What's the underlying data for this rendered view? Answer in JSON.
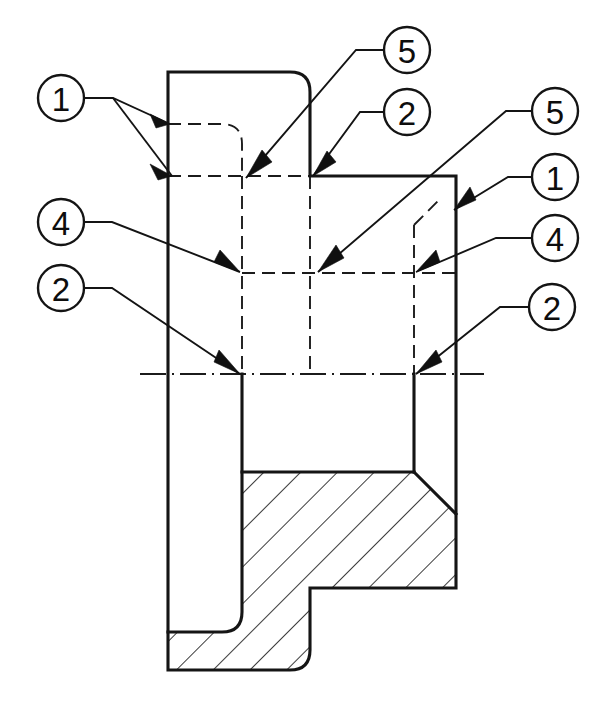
{
  "drawing": {
    "title": "Sectioned rotational part — feature callouts",
    "width": 607,
    "height": 708,
    "background_color": "#ffffff",
    "line_color": "#141414",
    "hatch_color": "#181818",
    "view_type": "half-section elevation",
    "line_styles": {
      "visible_edge": "solid thick",
      "hidden_edge": "dashed",
      "axis": "dash-dot centerline",
      "section_fill": "45-degree hatching"
    }
  },
  "balloons": [
    {
      "id": "balloon-1-top-left",
      "label": "1",
      "cx": 61,
      "cy": 98,
      "r": 23
    },
    {
      "id": "balloon-4-left",
      "label": "4",
      "cx": 61,
      "cy": 222,
      "r": 23
    },
    {
      "id": "balloon-2-left",
      "label": "2",
      "cx": 61,
      "cy": 288,
      "r": 23
    },
    {
      "id": "balloon-5-top-center",
      "label": "5",
      "cx": 407,
      "cy": 50,
      "r": 23
    },
    {
      "id": "balloon-2-top-center",
      "label": "2",
      "cx": 407,
      "cy": 112,
      "r": 23
    },
    {
      "id": "balloon-5-right",
      "label": "5",
      "cx": 555,
      "cy": 111,
      "r": 23
    },
    {
      "id": "balloon-1-right",
      "label": "1",
      "cx": 555,
      "cy": 177,
      "r": 23
    },
    {
      "id": "balloon-4-right",
      "label": "4",
      "cx": 555,
      "cy": 238,
      "r": 23
    },
    {
      "id": "balloon-2-right",
      "label": "2",
      "cx": 552,
      "cy": 307,
      "r": 23
    }
  ],
  "callout_items": [
    {
      "number": "1",
      "count": 2,
      "meaning": "outer cylindrical surface edge"
    },
    {
      "number": "2",
      "count": 3,
      "meaning": "shoulder / step face"
    },
    {
      "number": "4",
      "count": 2,
      "meaning": "internal bore hidden edge"
    },
    {
      "number": "5",
      "count": 2,
      "meaning": "corner radius / fillet"
    }
  ],
  "geometry": {
    "outer_left_wall_x": 168,
    "outer_right_wall_x": 456,
    "upper_block_right_x": 310,
    "top_edge_y": 72,
    "step_shoulder_y": 176,
    "centerline_y": 374,
    "bottom_edge_y": 670,
    "bore_left_x": 242,
    "bore_right_x": 414,
    "hatch_top_y": 472
  }
}
